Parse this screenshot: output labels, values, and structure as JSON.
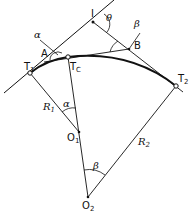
{
  "diagram": {
    "points": {
      "I": {
        "label": "I",
        "x": 93,
        "y": 22
      },
      "A": {
        "label": "A",
        "x": 55,
        "y": 55
      },
      "B": {
        "label": "B",
        "x": 129,
        "y": 49
      },
      "T1": {
        "label": "T",
        "sub": "1",
        "x": 30,
        "y": 73
      },
      "Tc": {
        "label": "T",
        "sub": "C",
        "x": 68,
        "y": 57
      },
      "T2": {
        "label": "T",
        "sub": "2",
        "x": 176,
        "y": 86
      },
      "O1": {
        "label": "O",
        "sub": "1",
        "x": 79,
        "y": 132
      },
      "O2": {
        "label": "O",
        "sub": "2",
        "x": 88,
        "y": 197
      }
    },
    "radii": {
      "R1": {
        "label": "R",
        "sub": "1"
      },
      "R2": {
        "label": "R",
        "sub": "2"
      }
    },
    "angles": {
      "alpha": "α",
      "beta": "β",
      "theta": "θ"
    }
  }
}
